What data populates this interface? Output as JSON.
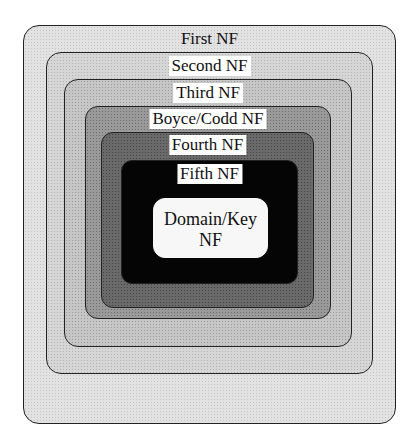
{
  "diagram": {
    "levels": [
      {
        "label": "First NF"
      },
      {
        "label": "Second NF"
      },
      {
        "label": "Third NF"
      },
      {
        "label": "Boyce/Codd NF"
      },
      {
        "label": "Fourth NF"
      },
      {
        "label": "Fifth NF"
      },
      {
        "label_line1": "Domain/Key",
        "label_line2": "NF"
      }
    ]
  }
}
